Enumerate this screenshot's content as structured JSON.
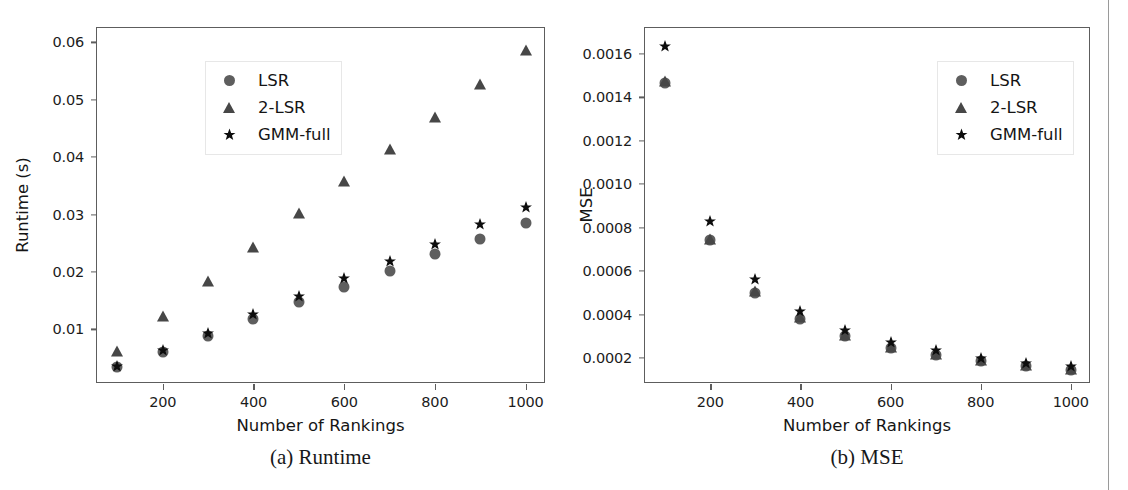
{
  "figure": {
    "panels": [
      {
        "id": "a",
        "caption": "(a) Runtime",
        "xlabel": "Number of Rankings",
        "ylabel": "Runtime (s)",
        "legend_position": "upper left"
      },
      {
        "id": "b",
        "caption": "(b) MSE",
        "xlabel": "Number of Rankings",
        "ylabel": "MSE",
        "legend_position": "upper right"
      }
    ],
    "legend_entries": [
      {
        "label": "LSR",
        "marker": "circle-marker",
        "color": "#5e5e5e"
      },
      {
        "label": "2-LSR",
        "marker": "triangle-marker",
        "color": "#474747"
      },
      {
        "label": "GMM-full",
        "marker": "star-marker",
        "color": "#0d0d0d"
      }
    ]
  },
  "chart_data": [
    {
      "type": "scatter",
      "id": "runtime",
      "title": "(a) Runtime",
      "xlabel": "Number of Rankings",
      "ylabel": "Runtime (s)",
      "x": [
        100,
        200,
        300,
        400,
        500,
        600,
        700,
        800,
        900,
        1000
      ],
      "xticks": [
        200,
        400,
        600,
        800,
        1000
      ],
      "xticklabels": [
        "200",
        "400",
        "600",
        "800",
        "1000"
      ],
      "yticks": [
        0.01,
        0.02,
        0.03,
        0.04,
        0.05,
        0.06
      ],
      "yticklabels": [
        "0.01",
        "0.02",
        "0.03",
        "0.04",
        "0.05",
        "0.06"
      ],
      "xlim": [
        55,
        1045
      ],
      "ylim": [
        0.0005,
        0.0625
      ],
      "grid": false,
      "legend": "upper left",
      "series": [
        {
          "name": "LSR",
          "marker": "circle",
          "values": [
            0.0035,
            0.006,
            0.0089,
            0.0118,
            0.0148,
            0.0174,
            0.0202,
            0.0232,
            0.0258,
            0.0285
          ]
        },
        {
          "name": "2-LSR",
          "marker": "triangle",
          "values": [
            0.0062,
            0.0124,
            0.0185,
            0.0244,
            0.0302,
            0.0359,
            0.0414,
            0.047,
            0.0528,
            0.0587
          ]
        },
        {
          "name": "GMM-full",
          "marker": "star",
          "values": [
            0.0036,
            0.0064,
            0.0094,
            0.0127,
            0.0158,
            0.0189,
            0.022,
            0.0248,
            0.0283,
            0.0314
          ]
        }
      ]
    },
    {
      "type": "scatter",
      "id": "mse",
      "title": "(b) MSE",
      "xlabel": "Number of Rankings",
      "ylabel": "MSE",
      "x": [
        100,
        200,
        300,
        400,
        500,
        600,
        700,
        800,
        900,
        1000
      ],
      "xticks": [
        200,
        400,
        600,
        800,
        1000
      ],
      "xticklabels": [
        "200",
        "400",
        "600",
        "800",
        "1000"
      ],
      "yticks": [
        0.0002,
        0.0004,
        0.0006,
        0.0008,
        0.001,
        0.0012,
        0.0014,
        0.0016
      ],
      "yticklabels": [
        "0.0002",
        "0.0004",
        "0.0006",
        "0.0008",
        "0.0010",
        "0.0012",
        "0.0014",
        "0.0016"
      ],
      "xlim": [
        55,
        1045
      ],
      "ylim": [
        8e-05,
        0.00172
      ],
      "grid": false,
      "legend": "upper right",
      "series": [
        {
          "name": "LSR",
          "marker": "circle",
          "values": [
            0.001468,
            0.000744,
            0.0005,
            0.000381,
            0.0003,
            0.000246,
            0.000212,
            0.000185,
            0.000163,
            0.000146
          ]
        },
        {
          "name": "2-LSR",
          "marker": "triangle",
          "values": [
            0.001474,
            0.00075,
            0.000507,
            0.000388,
            0.000306,
            0.000252,
            0.000216,
            0.000189,
            0.000166,
            0.00015
          ]
        },
        {
          "name": "GMM-full",
          "marker": "star",
          "values": [
            0.001635,
            0.000832,
            0.000563,
            0.000417,
            0.000328,
            0.000275,
            0.000235,
            0.000202,
            0.000175,
            0.000161
          ]
        }
      ]
    }
  ]
}
